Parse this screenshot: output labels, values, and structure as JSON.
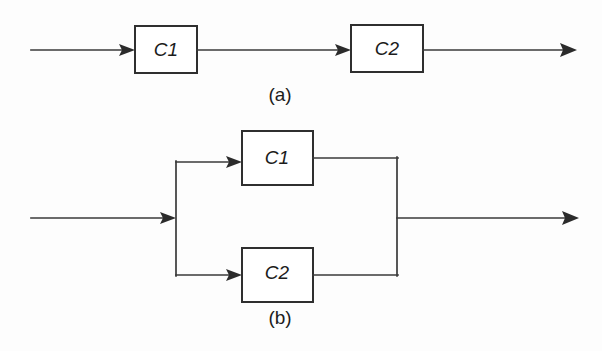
{
  "figure": {
    "background_color": "#fdfdfd",
    "line_color": "#3a3a3a",
    "box_fill": "#ffffff",
    "box_stroke": "#2f2f2f",
    "text_color": "#1c1c1c"
  },
  "panels": [
    {
      "id": "panel-a",
      "caption": "(a)",
      "caption_x": 280,
      "caption_y": 96,
      "topology": "series",
      "blocks": [
        {
          "label": "C1",
          "x": 135,
          "y": 26,
          "w": 62,
          "h": 47
        },
        {
          "label": "C2",
          "x": 351,
          "y": 25,
          "w": 72,
          "h": 47
        }
      ],
      "input_arrow": {
        "x1": 31,
        "y1": 50,
        "x2": 135,
        "y2": 50
      },
      "middle_arrow": {
        "x1": 197,
        "y1": 50,
        "x2": 351,
        "y2": 50
      },
      "output_arrow": {
        "x1": 423,
        "y1": 50,
        "x2": 576,
        "y2": 50
      }
    },
    {
      "id": "panel-b",
      "caption": "(b)",
      "caption_x": 280,
      "caption_y": 319,
      "topology": "parallel",
      "blocks": [
        {
          "label": "C1",
          "x": 242,
          "y": 131,
          "w": 71,
          "h": 54
        },
        {
          "label": "C2",
          "x": 242,
          "y": 248,
          "w": 71,
          "h": 54
        }
      ],
      "input_arrow": {
        "x1": 31,
        "y1": 218,
        "x2": 176,
        "y2": 218
      },
      "split_bar": {
        "x": 176,
        "y1": 162,
        "y2": 275
      },
      "merge_bar": {
        "x": 397,
        "y1": 158,
        "y2": 275
      },
      "branch_top_arrow": {
        "x1": 176,
        "y1": 162,
        "x2": 242,
        "y2": 162
      },
      "branch_bottom_arrow": {
        "x1": 176,
        "y1": 275,
        "x2": 242,
        "y2": 275
      },
      "merge_top_line": {
        "x1": 313,
        "y1": 158,
        "x2": 397,
        "y2": 158
      },
      "merge_bottom_line": {
        "x1": 313,
        "y1": 275,
        "x2": 397,
        "y2": 275
      },
      "output_arrow": {
        "x1": 397,
        "y1": 218,
        "x2": 578,
        "y2": 218
      }
    }
  ]
}
